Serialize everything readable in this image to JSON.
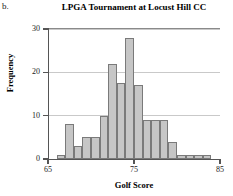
{
  "part_label": "b.",
  "chart_data": {
    "type": "bar",
    "title": "LPGA Tournament at Locust Hill CC",
    "xlabel": "Golf Score",
    "ylabel": "Frequency",
    "grid": true,
    "legend": "none",
    "bin_width": 1,
    "xlim": [
      65,
      85
    ],
    "ylim": [
      0,
      30
    ],
    "xticks": [
      65,
      75,
      85
    ],
    "xtick_labels": [
      "65",
      "75",
      "85"
    ],
    "yticks": [
      0,
      10,
      20,
      30
    ],
    "ytick_labels": [
      "0",
      "10",
      "20",
      "30"
    ],
    "categories": [
      "66-67",
      "67-68",
      "68-69",
      "69-70",
      "70-71",
      "71-72",
      "72-73",
      "73-74",
      "74-75",
      "75-76",
      "76-77",
      "77-78",
      "78-79",
      "79-80",
      "80-81",
      "81-82",
      "82-83",
      "83-84"
    ],
    "bin_starts": [
      66,
      67,
      68,
      69,
      70,
      71,
      72,
      73,
      74,
      75,
      76,
      77,
      78,
      79,
      80,
      81,
      82,
      83
    ],
    "values": [
      1,
      8,
      3,
      5,
      5,
      10,
      22,
      17.5,
      28,
      17,
      9,
      9,
      9,
      4,
      1,
      1,
      1,
      1
    ],
    "colors": {
      "bar_fill": "#c6c6c6",
      "bar_edge": "#7a7a7a",
      "grid": "#c9c9c9",
      "axis": "#555555"
    }
  }
}
